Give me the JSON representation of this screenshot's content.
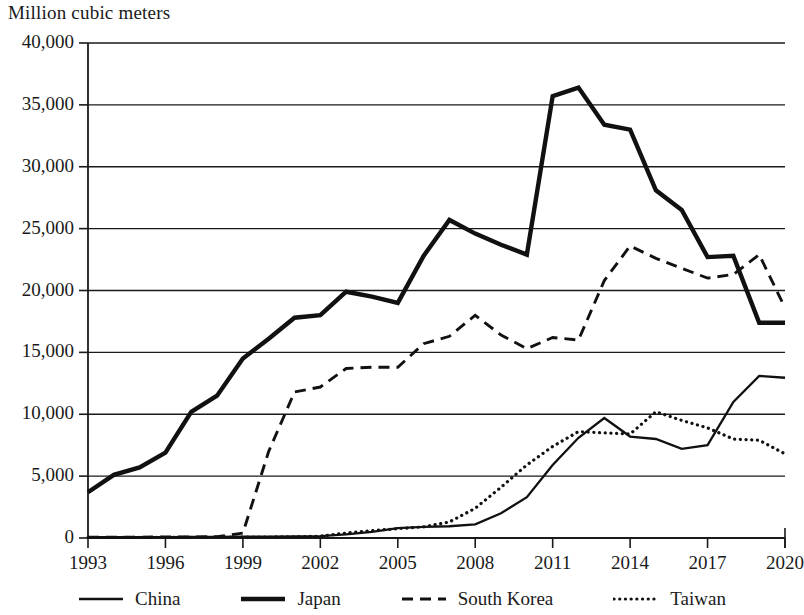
{
  "chart_data": {
    "type": "line",
    "title": "",
    "ylabel": "Million cubic meters",
    "xlabel": "",
    "ylim": [
      0,
      40000
    ],
    "xlim": [
      1993,
      2020
    ],
    "grid": true,
    "grid_axis": "y",
    "legend_position": "bottom",
    "ytick_labels": [
      "40,000",
      "35,000",
      "30,000",
      "25,000",
      "20,000",
      "15,000",
      "10,000",
      "5,000",
      "0"
    ],
    "ytick_values": [
      40000,
      35000,
      30000,
      25000,
      20000,
      15000,
      10000,
      5000,
      0
    ],
    "xtick_labels": [
      "1993",
      "1996",
      "1999",
      "2002",
      "2005",
      "2008",
      "2011",
      "2014",
      "2017",
      "2020"
    ],
    "xtick_values": [
      1993,
      1996,
      1999,
      2002,
      2005,
      2008,
      2011,
      2014,
      2017,
      2020
    ],
    "x": [
      1993,
      1994,
      1995,
      1996,
      1997,
      1998,
      1999,
      2000,
      2001,
      2002,
      2003,
      2004,
      2005,
      2006,
      2007,
      2008,
      2009,
      2010,
      2011,
      2012,
      2013,
      2014,
      2015,
      2016,
      2017,
      2018,
      2019,
      2020
    ],
    "series": [
      {
        "name": "China",
        "style": "solid-thin",
        "color": "#111111",
        "values": [
          60,
          60,
          70,
          70,
          80,
          90,
          100,
          110,
          130,
          150,
          300,
          500,
          800,
          900,
          950,
          1100,
          2000,
          3300,
          5900,
          8100,
          9700,
          8200,
          8000,
          7200,
          7500,
          11000,
          13100,
          12950
        ]
      },
      {
        "name": "Japan",
        "style": "solid-thick",
        "color": "#111111",
        "values": [
          3700,
          5100,
          5700,
          6900,
          10200,
          11500,
          14500,
          16100,
          17800,
          18000,
          19900,
          19500,
          19000,
          22800,
          25700,
          24600,
          23700,
          22900,
          35700,
          36400,
          33400,
          33000,
          28100,
          26500,
          22700,
          22800,
          17400,
          17400
        ]
      },
      {
        "name": "South Korea",
        "style": "dashed",
        "color": "#111111",
        "values": [
          60,
          60,
          70,
          80,
          90,
          100,
          400,
          7000,
          11800,
          12200,
          13700,
          13800,
          13800,
          15700,
          16300,
          18000,
          16400,
          15300,
          16200,
          16000,
          20800,
          23600,
          22600,
          21800,
          21000,
          21300,
          22900,
          18600
        ]
      },
      {
        "name": "Taiwan",
        "style": "dotted",
        "color": "#111111",
        "values": [
          40,
          40,
          50,
          50,
          60,
          60,
          70,
          80,
          100,
          150,
          400,
          600,
          750,
          900,
          1300,
          2400,
          4100,
          5900,
          7400,
          8600,
          8500,
          8400,
          10200,
          9500,
          8900,
          8000,
          7900,
          6800
        ]
      }
    ]
  },
  "legend": {
    "items": [
      {
        "label": "China",
        "style": "solid-thin"
      },
      {
        "label": "Japan",
        "style": "solid-thick"
      },
      {
        "label": "South Korea",
        "style": "dashed"
      },
      {
        "label": "Taiwan",
        "style": "dotted"
      }
    ]
  }
}
